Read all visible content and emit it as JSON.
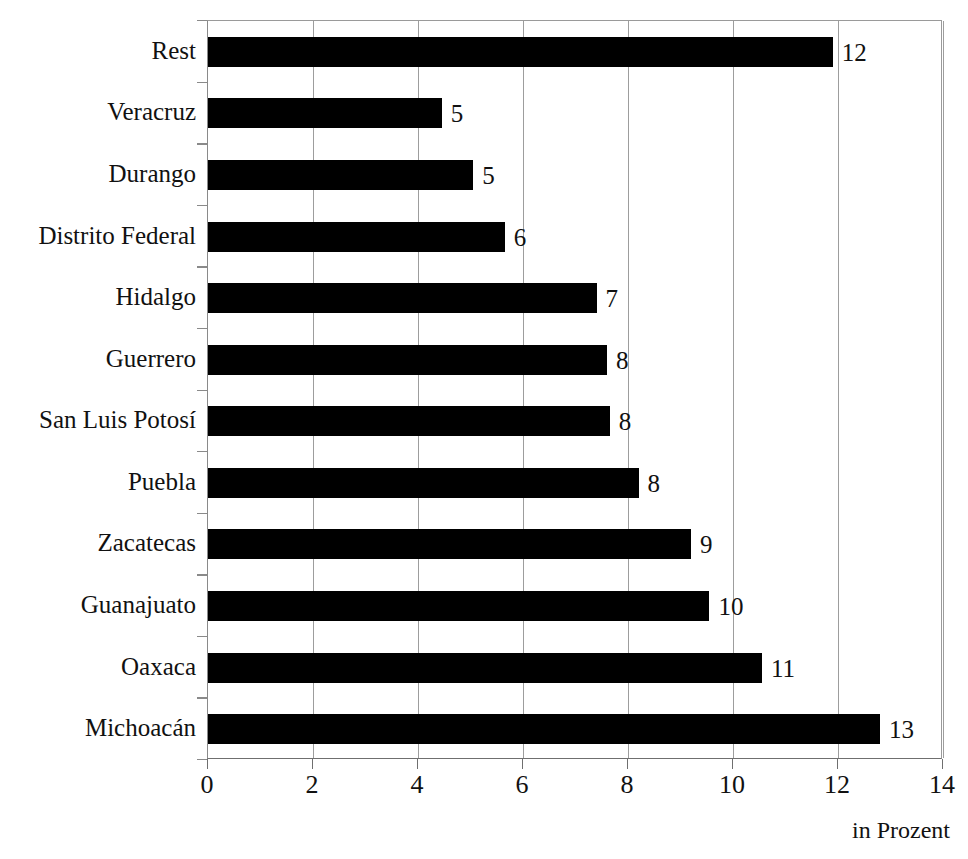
{
  "chart_data": {
    "type": "bar",
    "orientation": "horizontal",
    "title": "",
    "xlabel": "in Prozent",
    "ylabel": "",
    "xlim": [
      0,
      14
    ],
    "xticks": [
      0,
      2,
      4,
      6,
      8,
      10,
      12,
      14
    ],
    "grid": "vertical",
    "legend": "none",
    "bar_color": "#000000",
    "categories": [
      "Rest",
      "Veracruz",
      "Durango",
      "Distrito Federal",
      "Hidalgo",
      "Guerrero",
      "San Luis Potosí",
      "Puebla",
      "Zacatecas",
      "Guanajuato",
      "Oaxaca",
      "Michoacán"
    ],
    "values": [
      11.9,
      4.45,
      5.05,
      5.65,
      7.4,
      7.6,
      7.65,
      8.2,
      9.2,
      9.55,
      10.55,
      12.8
    ],
    "data_labels": [
      "12",
      "5",
      "5",
      "6",
      "7",
      "8",
      "8",
      "8",
      "9",
      "10",
      "11",
      "13"
    ]
  },
  "axis": {
    "tick_labels": [
      "0",
      "2",
      "4",
      "6",
      "8",
      "10",
      "12",
      "14"
    ],
    "caption": "in Prozent"
  },
  "colors": {
    "bar": "#000000",
    "grid": "#9d9d9d",
    "axis": "#6f6f6f",
    "text": "#111111",
    "background": "#ffffff"
  }
}
